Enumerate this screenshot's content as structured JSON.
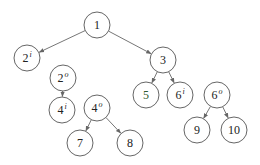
{
  "diagram": {
    "type": "tree",
    "radius": 13,
    "nodes": [
      {
        "id": "n1",
        "label": "1",
        "sup": "",
        "x": 97,
        "y": 25,
        "color": "#222222"
      },
      {
        "id": "n2i",
        "label": "2",
        "sup": "i",
        "x": 27,
        "y": 58,
        "color": "#222222"
      },
      {
        "id": "n3",
        "label": "3",
        "sup": "",
        "x": 163,
        "y": 60,
        "color": "#222222"
      },
      {
        "id": "n2o",
        "label": "2",
        "sup": "o",
        "x": 63,
        "y": 78,
        "color": "#222222"
      },
      {
        "id": "n4i",
        "label": "4",
        "sup": "i",
        "x": 62,
        "y": 110,
        "color": "#222222"
      },
      {
        "id": "n4o",
        "label": "4",
        "sup": "o",
        "x": 97,
        "y": 108,
        "color": "#222222"
      },
      {
        "id": "n5",
        "label": "5",
        "sup": "",
        "x": 146,
        "y": 95,
        "color": "#2f5a2f"
      },
      {
        "id": "n6i",
        "label": "6",
        "sup": "i",
        "x": 180,
        "y": 95,
        "color": "#222222"
      },
      {
        "id": "n6o",
        "label": "6",
        "sup": "o",
        "x": 217,
        "y": 95,
        "color": "#222222"
      },
      {
        "id": "n7",
        "label": "7",
        "sup": "",
        "x": 80,
        "y": 143,
        "color": "#222222"
      },
      {
        "id": "n8",
        "label": "8",
        "sup": "",
        "x": 130,
        "y": 143,
        "color": "#222222"
      },
      {
        "id": "n9",
        "label": "9",
        "sup": "",
        "x": 197,
        "y": 130,
        "color": "#222222"
      },
      {
        "id": "n10",
        "label": "10",
        "sup": "",
        "x": 234,
        "y": 130,
        "color": "#222222"
      }
    ],
    "edges": [
      {
        "from": "n1",
        "to": "n2i"
      },
      {
        "from": "n1",
        "to": "n3"
      },
      {
        "from": "n2o",
        "to": "n4i"
      },
      {
        "from": "n4o",
        "to": "n7"
      },
      {
        "from": "n4o",
        "to": "n8"
      },
      {
        "from": "n3",
        "to": "n5"
      },
      {
        "from": "n3",
        "to": "n6i"
      },
      {
        "from": "n6o",
        "to": "n9"
      },
      {
        "from": "n6o",
        "to": "n10"
      }
    ]
  }
}
